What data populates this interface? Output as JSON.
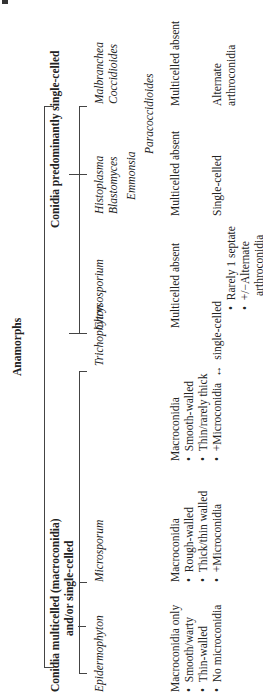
{
  "diagram": {
    "root": "Anamorphs",
    "groups": [
      {
        "label_line1": "Conidia multicelled (macroconidia)",
        "label_line2": "and/or single-celled",
        "genera": [
          {
            "name": "Epidermophyton",
            "desc": [
              "Macroconidia only",
              "Smooth/warty",
              "Thin-walled",
              "No microconidia"
            ],
            "bulleted_from": 1
          },
          {
            "name": "Microsporum",
            "desc": [
              "Macroconidia",
              "Rough-walled",
              "Thick/thin walled",
              "+Microconidia"
            ],
            "bulleted_from": 1
          },
          {
            "name": "Trichophyton",
            "desc": [
              "Macroconidia",
              "Smooth-walled",
              "Thin/rarely thick",
              "+Microconidia"
            ],
            "bulleted_from": 1
          }
        ],
        "link_symbol": "↔"
      },
      {
        "label": "Conidia predominantly single-celled",
        "genera": [
          {
            "name": "Chrysosporium",
            "desc": [
              "Multicelled absent",
              "single-celled",
              "Rarely 1 septate",
              "+/−Alternate",
              "arthroconidia"
            ]
          },
          {
            "names": [
              "Histoplasma",
              "Blastomyces",
              "Emmonsia",
              "Paracoccidioides"
            ],
            "desc": [
              "Multicelled absent",
              "Single-celled"
            ]
          },
          {
            "names": [
              "Malbranchea",
              "Coccidioides"
            ],
            "desc": [
              "Multicelled absent",
              "Alternate",
              "arthroconidia"
            ]
          }
        ]
      }
    ]
  }
}
